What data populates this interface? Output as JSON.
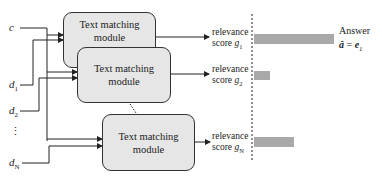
{
  "diagram": {
    "inputs": [
      {
        "id": "c",
        "label": "c",
        "sub": ""
      },
      {
        "id": "d1",
        "label": "d",
        "sub": "1"
      },
      {
        "id": "d2",
        "label": "d",
        "sub": "2"
      },
      {
        "id": "ellipsis",
        "label": "⋮",
        "sub": ""
      },
      {
        "id": "dN",
        "label": "d",
        "sub": "N"
      }
    ],
    "modules": [
      {
        "line1": "Text matching",
        "line2": "module"
      },
      {
        "line1": "Text matching",
        "line2": "module"
      },
      {
        "line1": "Text matching",
        "line2": "module"
      }
    ],
    "scores": [
      {
        "line1": "relevance",
        "line2_prefix": "score ",
        "symbol": "g",
        "sub": "1",
        "bar_width": 80
      },
      {
        "line1": "relevance",
        "line2_prefix": "score ",
        "symbol": "g",
        "sub": "2",
        "bar_width": 16
      },
      {
        "line1": "relevance",
        "line2_prefix": "score ",
        "symbol": "g",
        "sub": "N",
        "bar_width": 40
      }
    ],
    "answer": {
      "label": "Answer",
      "lhs": "â",
      "eq": " = ",
      "rhs": "e",
      "rhs_sub": "1"
    },
    "colors": {
      "box_fill": "#e6e6e6",
      "bar_fill": "#a9a9a9",
      "line": "#222222"
    }
  }
}
